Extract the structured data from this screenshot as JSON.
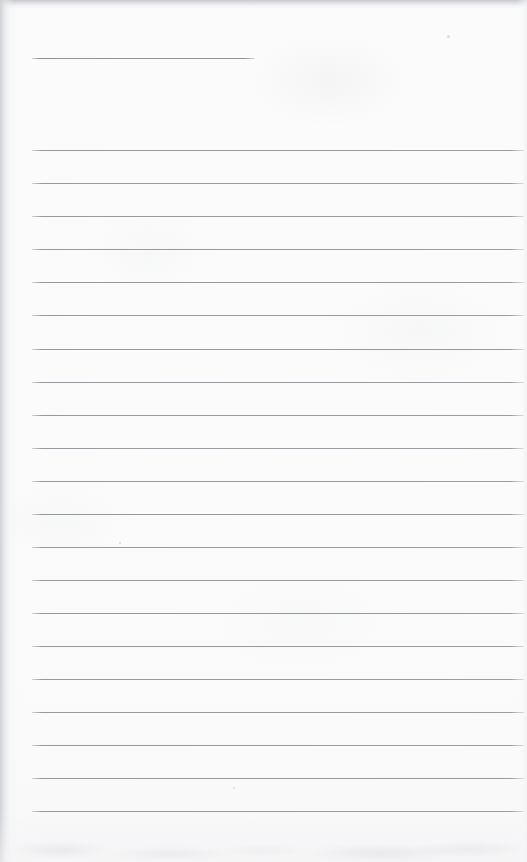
{
  "document": {
    "kind": "scanned-lined-notepaper",
    "title_text": "",
    "body_text": "",
    "page_width": 527,
    "page_height": 862,
    "colors": {
      "paper": "#fbfbfb",
      "rule": "#9b9ca0",
      "scan_edge": "#c4c6c9",
      "smudge": "#e2e3e6"
    },
    "title_rule": {
      "label": "title-rule",
      "x": 32,
      "y": 58,
      "width": 223
    },
    "rules_geometry": {
      "left": 32,
      "right": 524,
      "width": 492,
      "first_y": 150,
      "spacing": 33.05,
      "count": 21
    },
    "rules": [
      {
        "index": 1,
        "y": 150,
        "text": ""
      },
      {
        "index": 2,
        "y": 183,
        "text": ""
      },
      {
        "index": 3,
        "y": 216,
        "text": ""
      },
      {
        "index": 4,
        "y": 249,
        "text": ""
      },
      {
        "index": 5,
        "y": 282,
        "text": ""
      },
      {
        "index": 6,
        "y": 315,
        "text": ""
      },
      {
        "index": 7,
        "y": 349,
        "text": ""
      },
      {
        "index": 8,
        "y": 382,
        "text": ""
      },
      {
        "index": 9,
        "y": 415,
        "text": ""
      },
      {
        "index": 10,
        "y": 448,
        "text": ""
      },
      {
        "index": 11,
        "y": 481,
        "text": ""
      },
      {
        "index": 12,
        "y": 514,
        "text": ""
      },
      {
        "index": 13,
        "y": 547,
        "text": ""
      },
      {
        "index": 14,
        "y": 580,
        "text": ""
      },
      {
        "index": 15,
        "y": 613,
        "text": ""
      },
      {
        "index": 16,
        "y": 646,
        "text": ""
      },
      {
        "index": 17,
        "y": 679,
        "text": ""
      },
      {
        "index": 18,
        "y": 712,
        "text": ""
      },
      {
        "index": 19,
        "y": 745,
        "text": ""
      },
      {
        "index": 20,
        "y": 778,
        "text": ""
      },
      {
        "index": 21,
        "y": 811,
        "text": ""
      }
    ],
    "specks": [
      {
        "x": 119,
        "y": 542,
        "size": 2
      },
      {
        "x": 233,
        "y": 787,
        "size": 2
      },
      {
        "x": 447,
        "y": 35,
        "size": 3
      }
    ]
  }
}
